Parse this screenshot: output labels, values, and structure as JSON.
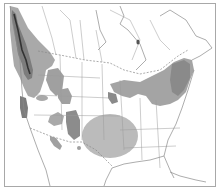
{
  "map": {
    "type": "range-map",
    "region": "North America",
    "legend": [],
    "colors": {
      "background": "#ffffff",
      "land": "#ffffff",
      "border": "#9a9a9a",
      "frame": "#a8a8a8",
      "range_dark": "#8c8c8c",
      "range_light": "#b9b9b9",
      "coast_dark": "#3a3a3a"
    },
    "ranges": [
      {
        "name": "pacific-northwest-coast",
        "shade": "dark"
      },
      {
        "name": "western-interior",
        "shade": "medium"
      },
      {
        "name": "great-lakes-northeast",
        "shade": "medium"
      },
      {
        "name": "southern-plains",
        "shade": "light"
      },
      {
        "name": "southwest-patches",
        "shade": "medium"
      }
    ]
  }
}
